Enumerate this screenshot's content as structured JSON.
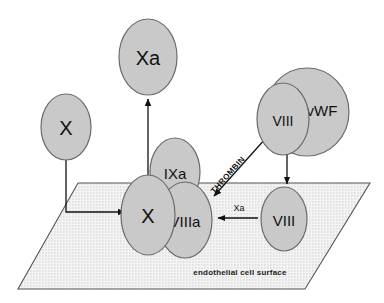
{
  "diagram": {
    "surface": {
      "caption": "endothelial cell surface",
      "fill_color": "#f2f2f2",
      "stroke_color": "#555555",
      "dot_color": "#b9b9b9"
    },
    "style": {
      "ellipse_fill": "#c9c9c9",
      "ellipse_stroke": "#6b6b6b",
      "arrow_color": "#111111",
      "text_color": "#111111",
      "background": "#ffffff"
    },
    "nodes": [
      {
        "id": "xa_free",
        "label": "Xa",
        "name": "factor-xa-free"
      },
      {
        "id": "x_free",
        "label": "X",
        "name": "factor-x-free"
      },
      {
        "id": "x_bound",
        "label": "X",
        "name": "factor-x-bound"
      },
      {
        "id": "ixa",
        "label": "IXa",
        "name": "factor-ixa"
      },
      {
        "id": "viiia",
        "label": "VIIIa",
        "name": "factor-viiia"
      },
      {
        "id": "viii_surface",
        "label": "VIII",
        "name": "factor-viii-surface"
      },
      {
        "id": "viii_complex",
        "label": "VIII",
        "name": "factor-viii-vwf-bound"
      },
      {
        "id": "vwf",
        "label": "vWF",
        "name": "von-willebrand-factor"
      }
    ],
    "arrows": [
      {
        "id": "x_to_surface",
        "label": "",
        "name": "arrow-x-to-surface",
        "from": "x_free",
        "to": "x_bound",
        "shape": "elbow"
      },
      {
        "id": "x_to_xa",
        "label": "",
        "name": "arrow-x-to-xa",
        "from": "x_bound",
        "to": "xa_free",
        "shape": "straight-up"
      },
      {
        "id": "thrombin",
        "label": "THROMBIN",
        "name": "arrow-thrombin",
        "from": "",
        "to": "viiia",
        "shape": "diagonal"
      },
      {
        "id": "viii_to_viiia",
        "label": "Xa",
        "name": "arrow-viii-to-viiia",
        "from": "viii_surface",
        "to": "viiia",
        "shape": "straight-left"
      },
      {
        "id": "complex_to_viii",
        "label": "",
        "name": "arrow-vwf-release-viii",
        "from": "viii_complex",
        "to": "viii_surface",
        "shape": "straight-down"
      }
    ]
  }
}
